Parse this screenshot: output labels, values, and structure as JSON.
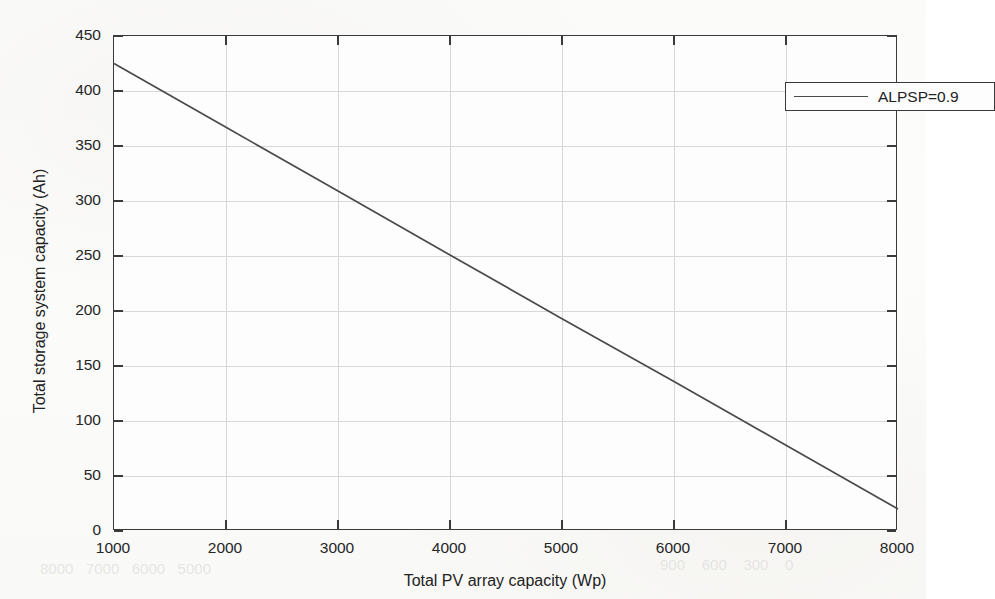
{
  "chart_data": {
    "type": "line",
    "title": "",
    "xlabel": "Total PV array capacity (Wp)",
    "ylabel": "Total storage system capacity (Ah)",
    "xlim": [
      1000,
      8000
    ],
    "ylim": [
      0,
      450
    ],
    "xticks": [
      1000,
      2000,
      3000,
      4000,
      5000,
      6000,
      7000,
      8000
    ],
    "yticks": [
      0,
      50,
      100,
      150,
      200,
      250,
      300,
      350,
      400,
      450
    ],
    "xtick_labels": [
      "1000",
      "2000",
      "3000",
      "4000",
      "5000",
      "6000",
      "7000",
      "8000"
    ],
    "ytick_labels": [
      "0",
      "50",
      "100",
      "150",
      "200",
      "250",
      "300",
      "350",
      "400",
      "450"
    ],
    "grid": true,
    "legend_position": "top-right",
    "series": [
      {
        "name": "ALPSP=0.9",
        "color": "#4a4a4a",
        "x": [
          1000,
          2000,
          3000,
          4000,
          5000,
          6000,
          7000,
          8000
        ],
        "values": [
          425,
          367,
          309,
          251,
          193,
          136,
          78,
          20
        ]
      }
    ]
  },
  "legend": {
    "entries": [
      {
        "label": "ALPSP=0.9",
        "line_color": "#4a4a4a"
      }
    ]
  },
  "axes": {
    "x_title": "Total PV array capacity (Wp)",
    "y_title": "Total storage system capacity (Ah)"
  },
  "colors": {
    "line": "#4a4a4a",
    "frame": "#3a3a3a",
    "grid": "#d8d8d4",
    "page": "#fbfbfa",
    "plot_background": "#fdfdfd"
  }
}
